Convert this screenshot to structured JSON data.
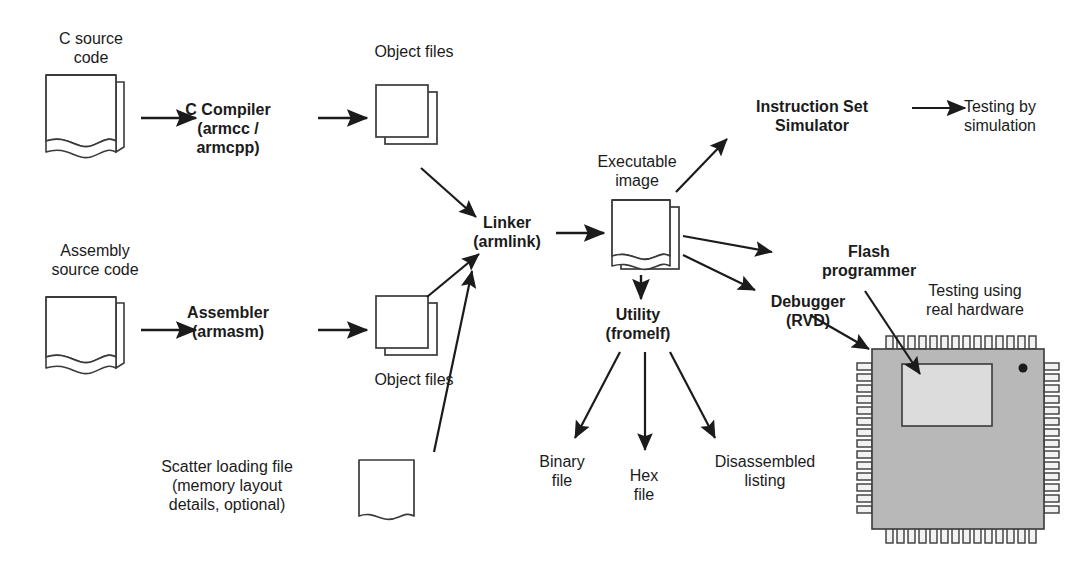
{
  "diagram": {
    "colors": {
      "line": "#1b1b1b",
      "chip_body": "#b8b8b8",
      "chip_flash": "#dcdcdc",
      "text": "#1b1b1b",
      "background": "#ffffff"
    },
    "labels": {
      "c_source": "C source\ncode",
      "c_source_ext": ".c\n.cpp",
      "c_compiler": "C Compiler\n(armcc /\narmcpp)",
      "object_files_top": "Object files",
      "object_ext_top": ".o",
      "assembly_source": "Assembly\nsource code",
      "assembly_ext": ".s",
      "assembler": "Assembler\n(armasm)",
      "object_files_bottom": "Object files",
      "object_ext_bottom": ".o",
      "scatter_file": "Scatter loading file\n(memory layout\ndetails, optional)",
      "scatter_ext": ".scat",
      "linker": "Linker\n(armlink)",
      "executable_image": "Executable\nimage",
      "executable_ext": ".elf\n.axf",
      "utility": "Utility\n(fromelf)",
      "binary_file": "Binary\nfile",
      "hex_file": "Hex\nfile",
      "disassembled_listing": "Disassembled\nlisting",
      "instruction_set_simulator": "Instruction Set\nSimulator",
      "testing_by_simulation": "Testing by\nsimulation",
      "flash_programmer": "Flash\nprogrammer",
      "debugger": "Debugger\n(RVD)",
      "testing_real_hardware": "Testing using\nreal hardware",
      "chip_flash": "Flash",
      "chip_name": "ARM\nCortex-M0\nMicrocontroller"
    }
  }
}
